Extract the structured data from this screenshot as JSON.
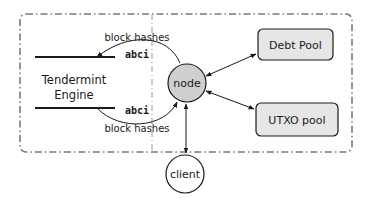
{
  "diagram": {
    "engine": {
      "label_line1": "Tendermint",
      "label_line2": "Engine"
    },
    "top_edge": {
      "label_above": "block hashes",
      "label_below": "abci"
    },
    "bottom_edge": {
      "label_above": "abci",
      "label_below": "block hashes"
    },
    "nodes": {
      "node": "node",
      "debt_pool": "Debt Pool",
      "utxo_pool": "UTXO pool",
      "client": "client"
    },
    "colors": {
      "node_fill": "#cfcfcf",
      "pool_fill": "#e6e6e6",
      "stroke": "#1a1a1a",
      "frame": "#7a7a7a"
    }
  }
}
